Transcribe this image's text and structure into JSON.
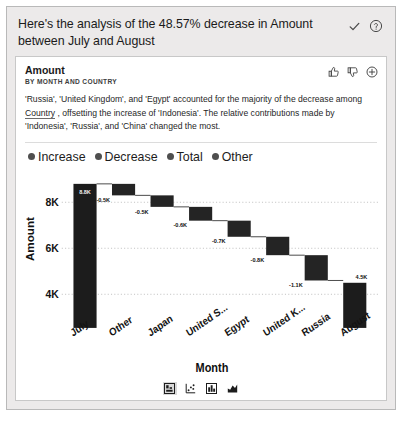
{
  "header": {
    "title": "Here's the analysis of the 48.57% decrease in Amount between July and August",
    "confirm_icon": "check-icon",
    "help_icon": "help-circle-icon"
  },
  "card": {
    "title": "Amount",
    "subtitle": "BY MONTH AND COUNTRY",
    "actions": [
      {
        "name": "thumbs-up-icon",
        "label": "Like"
      },
      {
        "name": "thumbs-down-icon",
        "label": "Dislike"
      },
      {
        "name": "plus-circle-icon",
        "label": "Add"
      }
    ],
    "narrative": {
      "line1": "'Russia', 'United Kingdom', and 'Egypt' accounted for the majority of the decrease",
      "line2_a": "among ",
      "line2_link": "Country",
      "line2_b": " , offsetting the increase of 'Indonesia'. The relative contributions made",
      "line3": "by 'Indonesia', 'Russia', and 'China' changed the most."
    }
  },
  "chart_data": {
    "type": "bar",
    "subtype": "waterfall",
    "title": "Amount",
    "subtitle": "BY MONTH AND COUNTRY",
    "xlabel": "Month",
    "ylabel": "Amount",
    "ylim": [
      3600,
      9200
    ],
    "yticks": [
      4000,
      6000,
      8000
    ],
    "ytick_labels": [
      "4K",
      "6K",
      "8K"
    ],
    "grid": true,
    "legend_position": "top-left",
    "legend": [
      {
        "label": "Increase",
        "color": "#4f4f4f"
      },
      {
        "label": "Decrease",
        "color": "#4f4f4f"
      },
      {
        "label": "Total",
        "color": "#4f4f4f"
      },
      {
        "label": "Other",
        "color": "#4f4f4f"
      }
    ],
    "categories": [
      "July",
      "Other",
      "Japan",
      "United S...",
      "Egypt",
      "United K...",
      "Russia",
      "August"
    ],
    "kinds": [
      "total",
      "other",
      "decrease",
      "decrease",
      "decrease",
      "decrease",
      "decrease",
      "total"
    ],
    "data_labels": [
      "8.8K",
      "-0.5K",
      "-0.5K",
      "-0.6K",
      "-0.7K",
      "-0.8K",
      "-1.1K",
      "4.5K"
    ],
    "values": [
      8800,
      -500,
      -500,
      -600,
      -700,
      -800,
      -1100,
      4500
    ],
    "bar_spans": [
      {
        "category": "July",
        "start": 0,
        "end": 8800
      },
      {
        "category": "Other",
        "start": 8800,
        "end": 8300
      },
      {
        "category": "Japan",
        "start": 8300,
        "end": 7800
      },
      {
        "category": "United S...",
        "start": 7800,
        "end": 7200
      },
      {
        "category": "Egypt",
        "start": 7200,
        "end": 6500
      },
      {
        "category": "United K...",
        "start": 6500,
        "end": 5700
      },
      {
        "category": "Russia",
        "start": 5700,
        "end": 4600
      },
      {
        "category": "August",
        "start": 0,
        "end": 4500
      }
    ]
  },
  "chart_types": [
    {
      "name": "waterfall-chart-icon",
      "label": "Waterfall chart",
      "selected": true
    },
    {
      "name": "scatter-chart-icon",
      "label": "Scatter chart",
      "selected": false
    },
    {
      "name": "column-chart-icon",
      "label": "Column chart",
      "selected": false
    },
    {
      "name": "area-chart-icon",
      "label": "Area chart",
      "selected": false
    }
  ]
}
